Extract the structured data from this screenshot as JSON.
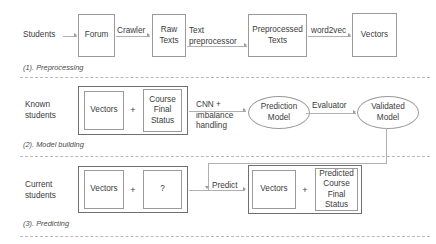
{
  "diagram": {
    "sections": [
      {
        "id": "preprocessing",
        "caption": "(1). Preprocessing",
        "source_label": "Students",
        "nodes": [
          {
            "name": "forum",
            "label": "Forum"
          },
          {
            "name": "raw-texts",
            "label": "Raw\nTexts"
          },
          {
            "name": "preprocessed-texts",
            "label": "Preprocessed\nTexts"
          },
          {
            "name": "vectors",
            "label": "Vectors"
          }
        ],
        "edges": [
          {
            "name": "edge-students-forum",
            "label": ""
          },
          {
            "name": "edge-forum-rawtexts",
            "label": "Crawler"
          },
          {
            "name": "edge-rawtexts-preprocessed",
            "label": "Text\npreprocessor"
          },
          {
            "name": "edge-preprocessed-vectors",
            "label": "word2vec"
          }
        ]
      },
      {
        "id": "model-building",
        "caption": "(2). Model building",
        "source_label": "Known\nstudents",
        "group": {
          "name": "known-students-group",
          "left": "Vectors",
          "operator": "+",
          "right": "Course\nFinal\nStatus"
        },
        "edges": [
          {
            "name": "edge-group-prediction",
            "label": "CNN +\nimbalance\nhandling"
          },
          {
            "name": "edge-prediction-validated",
            "label": "Evaluator"
          }
        ],
        "nodes": [
          {
            "name": "prediction-model",
            "label": "Prediction\nModel"
          },
          {
            "name": "validated-model",
            "label": "Validated\nModel"
          }
        ]
      },
      {
        "id": "predicting",
        "caption": "(3). Predicting",
        "source_label": "Current\nstudents",
        "group_in": {
          "name": "current-students-group",
          "left": "Vectors",
          "operator": "+",
          "right": "?"
        },
        "group_out": {
          "name": "predicted-result-group",
          "left": "Vectors",
          "operator": "+",
          "right": "Predicted\nCourse\nFinal\nStatus"
        },
        "edges": [
          {
            "name": "edge-predict",
            "label": "Predict"
          }
        ]
      }
    ],
    "colors": {
      "stroke": "#9a9a9a",
      "outer_stroke": "#6f6f6f",
      "connector": "#b0b0b0",
      "divider": "#b9b9b9",
      "text": "#3b3b3b",
      "background": "#ffffff"
    }
  }
}
